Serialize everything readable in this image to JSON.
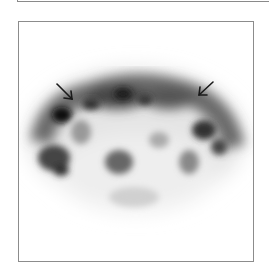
{
  "figure": {
    "colors": {
      "frame": "#8c8c8c",
      "background": "#ffffff",
      "uptake": "#000000"
    },
    "annotations": [
      {
        "type": "arrow",
        "label": "",
        "direction": "down-right",
        "position": "upper-left"
      },
      {
        "type": "arrow",
        "label": "",
        "direction": "down-left",
        "position": "upper-right"
      }
    ]
  }
}
